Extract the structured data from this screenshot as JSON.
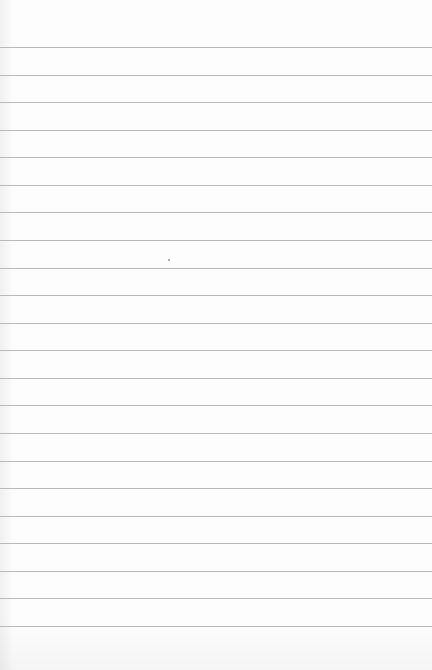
{
  "image": {
    "description": "Blank white lined notebook paper",
    "width": 432,
    "height": 670,
    "colors": {
      "paper": "#fdfdfd",
      "rule": "#b9b9b9"
    }
  },
  "rules": {
    "count": 22,
    "first_y": 47,
    "spacing": 27.57
  },
  "speck": {
    "x": 168,
    "y": 259
  }
}
